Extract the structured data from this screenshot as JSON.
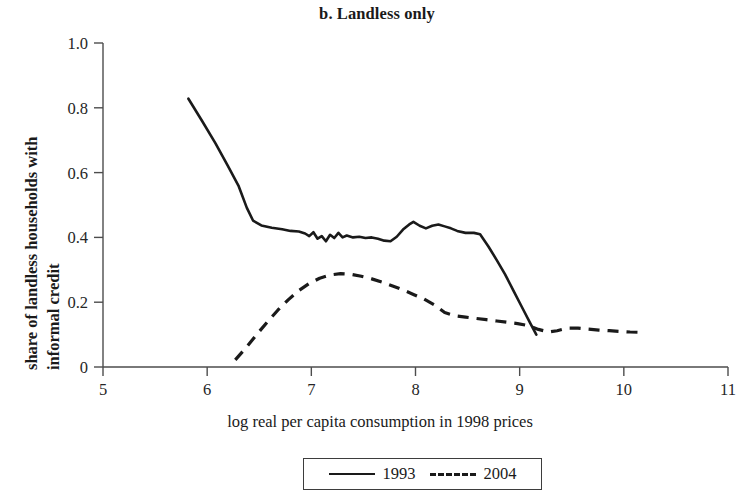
{
  "chart_data": {
    "type": "line",
    "title": "b. Landless only",
    "subtitle": "",
    "xlabel": "log real per capita consumption in 1998 prices",
    "ylabel": "share of landless households with informal credit",
    "ylabel_line1": "share of landless households with",
    "ylabel_line2": "informal credit",
    "xlim": [
      5,
      11
    ],
    "ylim": [
      0,
      1.0
    ],
    "xticks": [
      5,
      6,
      7,
      8,
      9,
      10,
      11
    ],
    "xtick_labels": [
      "5",
      "6",
      "7",
      "8",
      "9",
      "10",
      "11"
    ],
    "yticks": [
      0,
      0.2,
      0.4,
      0.6,
      0.8,
      1.0
    ],
    "ytick_labels": [
      "0",
      "0.2",
      "0.4",
      "0.6",
      "0.8",
      "1.0"
    ],
    "grid": false,
    "legend_position": "bottom-center",
    "colors": {
      "line": "#1a1a1a",
      "axis": "#4d4d4d",
      "background": "#ffffff"
    },
    "series": [
      {
        "name": "1993",
        "style": "solid",
        "points": [
          [
            5.82,
            0.828
          ],
          [
            5.95,
            0.76
          ],
          [
            6.08,
            0.69
          ],
          [
            6.2,
            0.62
          ],
          [
            6.3,
            0.56
          ],
          [
            6.38,
            0.492
          ],
          [
            6.44,
            0.452
          ],
          [
            6.52,
            0.437
          ],
          [
            6.62,
            0.43
          ],
          [
            6.72,
            0.425
          ],
          [
            6.8,
            0.42
          ],
          [
            6.88,
            0.418
          ],
          [
            6.94,
            0.412
          ],
          [
            6.98,
            0.404
          ],
          [
            7.02,
            0.416
          ],
          [
            7.06,
            0.396
          ],
          [
            7.1,
            0.404
          ],
          [
            7.14,
            0.388
          ],
          [
            7.18,
            0.408
          ],
          [
            7.22,
            0.398
          ],
          [
            7.26,
            0.414
          ],
          [
            7.3,
            0.4
          ],
          [
            7.34,
            0.406
          ],
          [
            7.4,
            0.4
          ],
          [
            7.46,
            0.402
          ],
          [
            7.52,
            0.398
          ],
          [
            7.58,
            0.4
          ],
          [
            7.64,
            0.396
          ],
          [
            7.7,
            0.39
          ],
          [
            7.76,
            0.388
          ],
          [
            7.82,
            0.402
          ],
          [
            7.88,
            0.424
          ],
          [
            7.94,
            0.44
          ],
          [
            7.98,
            0.448
          ],
          [
            8.04,
            0.436
          ],
          [
            8.1,
            0.428
          ],
          [
            8.16,
            0.436
          ],
          [
            8.22,
            0.44
          ],
          [
            8.28,
            0.434
          ],
          [
            8.34,
            0.428
          ],
          [
            8.4,
            0.42
          ],
          [
            8.48,
            0.414
          ],
          [
            8.56,
            0.414
          ],
          [
            8.62,
            0.41
          ],
          [
            8.7,
            0.372
          ],
          [
            8.78,
            0.33
          ],
          [
            8.86,
            0.286
          ],
          [
            8.94,
            0.236
          ],
          [
            9.02,
            0.186
          ],
          [
            9.1,
            0.136
          ],
          [
            9.16,
            0.1
          ]
        ]
      },
      {
        "name": "2004",
        "style": "dashed",
        "points": [
          [
            6.27,
            0.022
          ],
          [
            6.38,
            0.062
          ],
          [
            6.48,
            0.102
          ],
          [
            6.58,
            0.14
          ],
          [
            6.68,
            0.176
          ],
          [
            6.78,
            0.208
          ],
          [
            6.88,
            0.236
          ],
          [
            6.98,
            0.258
          ],
          [
            7.08,
            0.274
          ],
          [
            7.18,
            0.284
          ],
          [
            7.28,
            0.288
          ],
          [
            7.38,
            0.286
          ],
          [
            7.48,
            0.28
          ],
          [
            7.58,
            0.272
          ],
          [
            7.68,
            0.262
          ],
          [
            7.78,
            0.25
          ],
          [
            7.88,
            0.238
          ],
          [
            7.98,
            0.224
          ],
          [
            8.08,
            0.21
          ],
          [
            8.18,
            0.192
          ],
          [
            8.28,
            0.168
          ],
          [
            8.38,
            0.158
          ],
          [
            8.48,
            0.154
          ],
          [
            8.58,
            0.15
          ],
          [
            8.68,
            0.146
          ],
          [
            8.78,
            0.142
          ],
          [
            8.88,
            0.138
          ],
          [
            8.98,
            0.134
          ],
          [
            9.08,
            0.128
          ],
          [
            9.18,
            0.116
          ],
          [
            9.28,
            0.108
          ],
          [
            9.36,
            0.112
          ],
          [
            9.46,
            0.12
          ],
          [
            9.56,
            0.12
          ],
          [
            9.66,
            0.117
          ],
          [
            9.76,
            0.114
          ],
          [
            9.86,
            0.112
          ],
          [
            9.96,
            0.11
          ],
          [
            10.06,
            0.108
          ],
          [
            10.16,
            0.107
          ]
        ]
      }
    ]
  },
  "legend": {
    "entries": [
      {
        "label": "1993",
        "style": "solid"
      },
      {
        "label": "2004",
        "style": "dashed"
      }
    ]
  }
}
